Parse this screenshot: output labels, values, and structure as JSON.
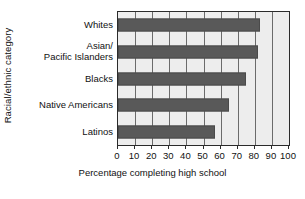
{
  "chart_data": {
    "type": "bar",
    "orientation": "horizontal",
    "title": "",
    "xlabel": "Percentage completing high school",
    "ylabel": "Racial/ethnic category",
    "categories": [
      "Whites",
      "Asian/\nPacific Islanders",
      "Blacks",
      "Native Americans",
      "Latinos"
    ],
    "category_lines": [
      [
        "Whites"
      ],
      [
        "Asian/",
        "Pacific Islanders"
      ],
      [
        "Blacks"
      ],
      [
        "Native Americans"
      ],
      [
        "Latinos"
      ]
    ],
    "values": [
      83,
      82,
      75,
      65,
      57
    ],
    "xlim": [
      0,
      100
    ],
    "xticks": [
      0,
      10,
      20,
      30,
      40,
      50,
      60,
      70,
      80,
      90,
      100
    ],
    "xtick_labels": [
      "0",
      "10",
      "20",
      "30",
      "40",
      "50",
      "60",
      "70",
      "80",
      "90",
      "100"
    ],
    "grid": "vertical",
    "legend": "none",
    "colors": {
      "bar_fill": "#595959",
      "bar_edge": "#4a4a4a",
      "plot_background": "#ededed",
      "grid_line": "#6b6b6b",
      "axis_line": "#2b2b2b",
      "text": "#111111",
      "figure_background": "#ffffff"
    }
  }
}
